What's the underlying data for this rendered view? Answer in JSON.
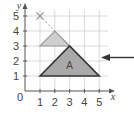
{
  "diagram": {
    "type": "coordinate-grid-enlargement",
    "axes": {
      "x_label": "x",
      "y_label": "y",
      "origin_label": "0",
      "x_ticks": [
        "1",
        "2",
        "3",
        "4",
        "5"
      ],
      "y_ticks": [
        "1",
        "2",
        "3",
        "4",
        "5"
      ]
    },
    "centre_marker": {
      "label": "×",
      "x": 1,
      "y": 5
    },
    "small_triangle": {
      "vertices": [
        [
          1,
          3
        ],
        [
          2,
          4
        ],
        [
          3,
          3
        ]
      ],
      "fill": "#cfcfcf",
      "stroke": "#999999"
    },
    "triangle_A": {
      "label": "A",
      "vertices": [
        [
          1,
          1
        ],
        [
          3,
          3
        ],
        [
          5,
          1
        ]
      ],
      "fill": "#a9a9a9",
      "stroke": "#333333"
    },
    "arrow": {
      "direction": "left",
      "color": "#333333"
    },
    "colors": {
      "grid": "#c8c8c8",
      "axis": "#555555",
      "dashed": "#999999"
    }
  }
}
